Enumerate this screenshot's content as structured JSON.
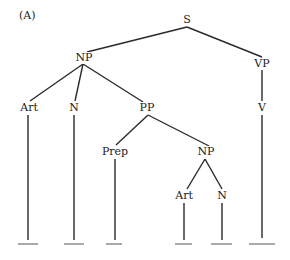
{
  "panel_label": "(A)",
  "tree": {
    "S": "S",
    "NP": "NP",
    "VP": "VP",
    "Art": "Art",
    "N": "N",
    "PP": "PP",
    "V": "V",
    "Prep": "Prep",
    "NP2": "NP",
    "Art2": "Art",
    "N2": "N"
  },
  "leaves": [
    "___",
    "___",
    "___",
    "___",
    "___",
    "___"
  ]
}
